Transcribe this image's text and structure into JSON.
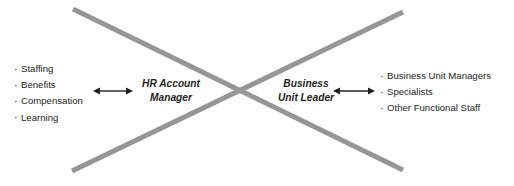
{
  "diagram": {
    "colors": {
      "cross_line": "#969696",
      "text": "#231f20",
      "arrow": "#231f20",
      "background": "#ffffff"
    },
    "left_list": {
      "name": "hr-functions-list",
      "items": [
        "Staffing",
        "Benefits",
        "Compensation",
        "Learning"
      ]
    },
    "right_list": {
      "name": "business-roles-list",
      "items": [
        "Business Unit Managers",
        "Specialists",
        "Other Functional Staff"
      ]
    },
    "center_roles": [
      {
        "name": "hr-account-manager",
        "line1": "HR Account",
        "line2": "Manager"
      },
      {
        "name": "business-unit-leader",
        "line1": "Business",
        "line2": "Unit Leader"
      }
    ],
    "connectors": [
      {
        "name": "left-double-arrow",
        "type": "double-headed-arrow"
      },
      {
        "name": "right-double-arrow",
        "type": "double-headed-arrow"
      }
    ],
    "cross": {
      "name": "x-cross-lines",
      "stroke_width": 5,
      "lines": [
        {
          "x1": 73,
          "y1": 9,
          "x2": 403,
          "y2": 170
        },
        {
          "x1": 403,
          "y1": 12,
          "x2": 72,
          "y2": 171
        }
      ]
    }
  }
}
